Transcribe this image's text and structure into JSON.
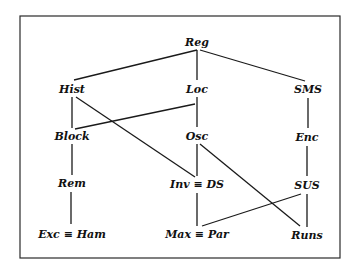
{
  "diagram": {
    "type": "lattice",
    "frame": {
      "x": 20,
      "y": 16,
      "width": 320,
      "height": 242
    },
    "nodes": [
      {
        "id": "Reg",
        "label": "Reg",
        "x": 197,
        "y": 43
      },
      {
        "id": "Hist",
        "label": "Hist",
        "x": 72,
        "y": 90
      },
      {
        "id": "Loc",
        "label": "Loc",
        "x": 197,
        "y": 90
      },
      {
        "id": "SMS",
        "label": "SMS",
        "x": 308,
        "y": 90
      },
      {
        "id": "Block",
        "label": "Block",
        "x": 72,
        "y": 137
      },
      {
        "id": "Osc",
        "label": "Osc",
        "x": 197,
        "y": 137
      },
      {
        "id": "Enc",
        "label": "Enc",
        "x": 307,
        "y": 138
      },
      {
        "id": "Rem",
        "label": "Rem",
        "x": 72,
        "y": 184
      },
      {
        "id": "Inv",
        "label": "Inv ≡ DS",
        "x": 197,
        "y": 185
      },
      {
        "id": "SUS",
        "label": "SUS",
        "x": 307,
        "y": 186
      },
      {
        "id": "Exc",
        "label": "Exc ≡ Ham",
        "x": 72,
        "y": 235
      },
      {
        "id": "Max",
        "label": "Max ≡ Par",
        "x": 197,
        "y": 235
      },
      {
        "id": "Runs",
        "label": "Runs",
        "x": 307,
        "y": 236
      }
    ],
    "edges": [
      {
        "from": "Reg",
        "to": "Hist",
        "x1": 197,
        "y1": 50,
        "x2": 74,
        "y2": 80
      },
      {
        "from": "Reg",
        "to": "Loc",
        "x1": 197,
        "y1": 50,
        "x2": 197,
        "y2": 80
      },
      {
        "from": "Reg",
        "to": "SMS",
        "x1": 200,
        "y1": 50,
        "x2": 305,
        "y2": 81
      },
      {
        "from": "Hist",
        "to": "Block",
        "x1": 72,
        "y1": 97,
        "x2": 72,
        "y2": 128
      },
      {
        "from": "Hist",
        "to": "Inv",
        "x1": 76,
        "y1": 97,
        "x2": 195,
        "y2": 177
      },
      {
        "from": "Loc",
        "to": "Block",
        "x1": 195,
        "y1": 104,
        "x2": 75,
        "y2": 129
      },
      {
        "from": "Loc",
        "to": "Osc",
        "x1": 197,
        "y1": 97,
        "x2": 197,
        "y2": 127
      },
      {
        "from": "SMS",
        "to": "Enc",
        "x1": 308,
        "y1": 98,
        "x2": 308,
        "y2": 128
      },
      {
        "from": "Block",
        "to": "Rem",
        "x1": 72,
        "y1": 144,
        "x2": 72,
        "y2": 175
      },
      {
        "from": "Osc",
        "to": "Inv",
        "x1": 197,
        "y1": 144,
        "x2": 197,
        "y2": 176
      },
      {
        "from": "Osc",
        "to": "Runs",
        "x1": 200,
        "y1": 144,
        "x2": 300,
        "y2": 226
      },
      {
        "from": "Enc",
        "to": "SUS",
        "x1": 307,
        "y1": 146,
        "x2": 307,
        "y2": 176
      },
      {
        "from": "Rem",
        "to": "Exc",
        "x1": 71,
        "y1": 192,
        "x2": 71,
        "y2": 224
      },
      {
        "from": "Inv",
        "to": "Max",
        "x1": 197,
        "y1": 193,
        "x2": 197,
        "y2": 226
      },
      {
        "from": "SUS",
        "to": "Max",
        "x1": 301,
        "y1": 194,
        "x2": 202,
        "y2": 226
      },
      {
        "from": "SUS",
        "to": "Runs",
        "x1": 307,
        "y1": 194,
        "x2": 307,
        "y2": 227
      }
    ]
  }
}
